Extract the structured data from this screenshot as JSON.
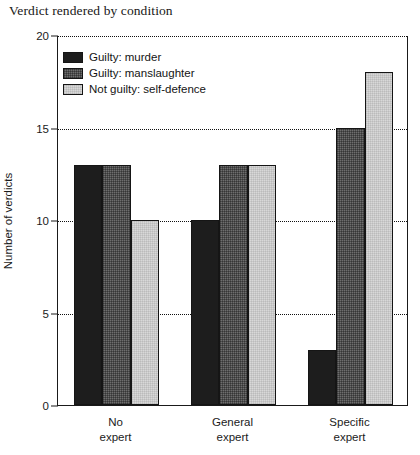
{
  "chart_data": {
    "type": "bar",
    "title": "Verdict rendered by condition",
    "xlabel": "",
    "ylabel": "Number of verdicts",
    "ylim": [
      0,
      20
    ],
    "yticks": [
      0,
      5,
      10,
      15,
      20
    ],
    "grid": "horizontal-dotted",
    "legend_position": "top-left-inside",
    "categories": [
      "No expert",
      "General expert",
      "Specific expert"
    ],
    "category_lines": [
      [
        "No",
        "expert"
      ],
      [
        "General",
        "expert"
      ],
      [
        "Specific",
        "expert"
      ]
    ],
    "series": [
      {
        "name": "Guilty: murder",
        "color": "#1d1d1d",
        "values": [
          13,
          10,
          3
        ]
      },
      {
        "name": "Guilty: manslaughter",
        "color": "#6e6e6e",
        "values": [
          13,
          13,
          15
        ]
      },
      {
        "name": "Not guilty: self-defence",
        "color": "#d8d8d8",
        "values": [
          10,
          13,
          18
        ]
      }
    ]
  }
}
